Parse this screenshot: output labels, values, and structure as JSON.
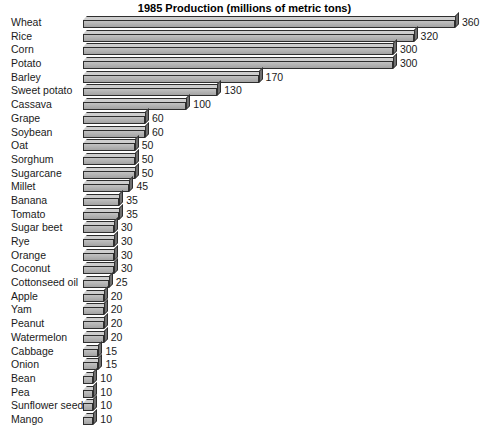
{
  "chart_data": {
    "type": "bar",
    "orientation": "horizontal",
    "title": "1985 Production (millions of metric tons)",
    "xlabel": "",
    "ylabel": "",
    "xlim": [
      0,
      360
    ],
    "grid": false,
    "legend": "none",
    "value_labels": true,
    "style": "3d-bars",
    "categories": [
      "Wheat",
      "Rice",
      "Corn",
      "Potato",
      "Barley",
      "Sweet potato",
      "Cassava",
      "Grape",
      "Soybean",
      "Oat",
      "Sorghum",
      "Sugarcane",
      "Millet",
      "Banana",
      "Tomato",
      "Sugar beet",
      "Rye",
      "Orange",
      "Coconut",
      "Cottonseed oil",
      "Apple",
      "Yam",
      "Peanut",
      "Watermelon",
      "Cabbage",
      "Onion",
      "Bean",
      "Pea",
      "Sunflower seed",
      "Mango"
    ],
    "values": [
      360,
      320,
      300,
      300,
      170,
      130,
      100,
      60,
      60,
      50,
      50,
      50,
      45,
      35,
      35,
      30,
      30,
      30,
      30,
      25,
      20,
      20,
      20,
      20,
      15,
      15,
      10,
      10,
      10,
      10
    ],
    "value_label_text": [
      "360",
      "320",
      "300",
      "300",
      "170",
      "130",
      "100",
      "60",
      "60",
      "50",
      "50",
      "50",
      "45",
      "35",
      "35",
      "30",
      "30",
      "30",
      "30",
      "25",
      "20",
      "20",
      "20",
      "20",
      "15",
      "15",
      "10",
      "10",
      "10",
      "10"
    ],
    "colors": {
      "bar_front": "#b4b4b4",
      "bar_top": "#cecece",
      "bar_cap": "#6f6f6f",
      "outline": "#2e2e2e",
      "text": "#1a1a1a",
      "background": "#ffffff"
    }
  }
}
